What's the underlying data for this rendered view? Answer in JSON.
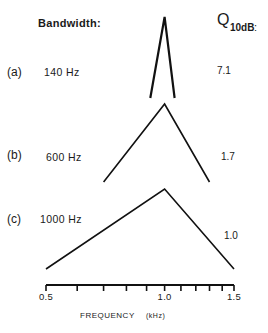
{
  "chart_data": {
    "type": "line",
    "title": "",
    "xlabel": "FREQUENCY",
    "xunit": "(kHz)",
    "xscale": "log",
    "xlim": [
      0.5,
      1.5
    ],
    "x_ticks": [
      0.5,
      0.6,
      0.7,
      0.8,
      0.9,
      1.0,
      1.1,
      1.2,
      1.3,
      1.4,
      1.5
    ],
    "x_tick_labels": [
      {
        "value": 0.5,
        "label": "0.5"
      },
      {
        "value": 1.0,
        "label": "1.0"
      },
      {
        "value": 1.5,
        "label": "1.5"
      }
    ],
    "column_headers": {
      "bandwidth": "Bandwidth:",
      "q_main": "Q",
      "q_sub": "10dB",
      "q_colon": ":"
    },
    "series": [
      {
        "name": "(a)",
        "bandwidth_label": "140 Hz",
        "q10db": "7.1",
        "center_khz": 1.0,
        "points_khz": [
          0.92,
          1.0,
          1.06
        ],
        "stroke": 2.2
      },
      {
        "name": "(b)",
        "bandwidth_label": "600 Hz",
        "q10db": "1.7",
        "center_khz": 1.0,
        "points_khz": [
          0.7,
          1.0,
          1.3
        ],
        "stroke": 1.6
      },
      {
        "name": "(c)",
        "bandwidth_label": "1000 Hz",
        "q10db": "1.0",
        "center_khz": 1.0,
        "points_khz": [
          0.5,
          1.0,
          1.5
        ],
        "stroke": 1.6
      }
    ],
    "grid": false,
    "legend": "none"
  }
}
